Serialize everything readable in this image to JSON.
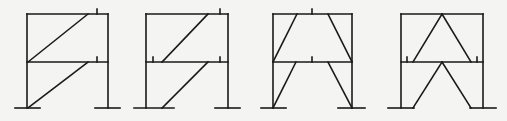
{
  "figure": {
    "line_color": "#1a1a1a",
    "background": "#f4f4f2",
    "frames": [
      {
        "id": "frame-1",
        "type": "single-diagonal-bracing-same-direction",
        "columns": [
          27,
          108
        ],
        "beams_y": [
          14,
          62
        ],
        "base_y": 108,
        "base_plates": [
          [
            15,
            40
          ],
          [
            95,
            120
          ]
        ],
        "braces": [
          [
            28,
            62,
            88,
            14
          ],
          [
            28,
            108,
            88,
            62
          ]
        ],
        "ticks": [
          [
            97,
            9,
            97,
            14
          ],
          [
            97,
            57,
            97,
            62
          ]
        ]
      },
      {
        "id": "frame-2",
        "type": "eccentric-single-diagonal-bracing",
        "columns": [
          146,
          228
        ],
        "beams_y": [
          14,
          62
        ],
        "base_y": 108,
        "base_plates": [
          [
            134,
            174
          ],
          [
            215,
            240
          ]
        ],
        "braces": [
          [
            162,
            62,
            208,
            14
          ],
          [
            162,
            108,
            208,
            62
          ]
        ],
        "ticks": [
          [
            220,
            9,
            220,
            14
          ],
          [
            153,
            57,
            153,
            62
          ],
          [
            220,
            57,
            220,
            62
          ]
        ]
      },
      {
        "id": "frame-3",
        "type": "eccentric-v-bracing-trapezoid",
        "columns": [
          273,
          352
        ],
        "beams_y": [
          14,
          62
        ],
        "base_y": 108,
        "base_plates": [
          [
            261,
            286
          ],
          [
            338,
            365
          ]
        ],
        "braces": [
          [
            297,
            14,
            273,
            62
          ],
          [
            328,
            14,
            352,
            62
          ],
          [
            296,
            62,
            273,
            108
          ],
          [
            328,
            62,
            352,
            108
          ]
        ],
        "ticks": [
          [
            312,
            9,
            312,
            14
          ],
          [
            312,
            57,
            312,
            62
          ]
        ]
      },
      {
        "id": "frame-4",
        "type": "inverted-v-chevron-bracing",
        "columns": [
          401,
          483
        ],
        "beams_y": [
          14,
          62
        ],
        "base_y": 108,
        "base_plates": [
          [
            388,
            414
          ],
          [
            470,
            496
          ]
        ],
        "braces": [
          [
            442,
            14,
            413,
            62
          ],
          [
            442,
            14,
            471,
            62
          ],
          [
            442,
            62,
            413,
            108
          ],
          [
            442,
            62,
            471,
            108
          ]
        ],
        "ticks": [
          [
            407,
            57,
            407,
            62
          ],
          [
            477,
            57,
            477,
            62
          ]
        ]
      }
    ]
  }
}
